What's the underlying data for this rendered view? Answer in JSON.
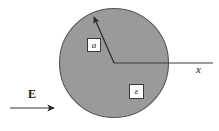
{
  "figure": {
    "type": "physics-diagram",
    "background_color": "#ffffff",
    "disc": {
      "name": "dielectric-region",
      "fill_color": "#9a9a9a",
      "stroke_color": "#4a4a4a",
      "center_x": 114,
      "center_y": 63,
      "radius": 55
    },
    "axis": {
      "label": "x",
      "stroke_color": "#3a3a3a",
      "from_x": 114,
      "to_x": 213,
      "y": 63
    },
    "radius_arrow": {
      "label": "a",
      "stroke_color": "#2a2a2a",
      "from_x": 114,
      "from_y": 63,
      "to_x": 92,
      "to_y": 13
    },
    "field_arrow": {
      "label": "E",
      "stroke_color": "#3a3a3a",
      "from_x": 10,
      "to_x": 61,
      "y": 108
    },
    "permittivity": {
      "label": "ε"
    }
  },
  "labels": {
    "radius": "a",
    "permittivity": "ε",
    "axis_x": "x",
    "field": "E"
  }
}
